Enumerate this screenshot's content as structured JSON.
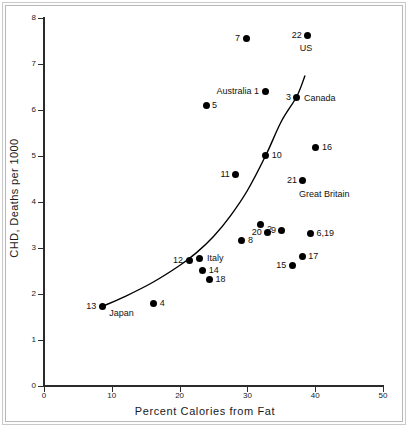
{
  "chart_data": {
    "type": "scatter",
    "title": "",
    "xlabel": "Percent Calories from Fat",
    "ylabel": "CHD, Deaths per 1000",
    "xlim": [
      0,
      50
    ],
    "ylim": [
      0,
      8
    ],
    "xticks": [
      0,
      10,
      20,
      30,
      40,
      50
    ],
    "yticks": [
      0,
      1,
      2,
      3,
      4,
      5,
      6,
      7,
      8
    ],
    "grid": false,
    "legend": "none",
    "points": [
      {
        "id": "1",
        "label": "Australia 1",
        "label_side": "left",
        "x": 32.6,
        "y": 6.4
      },
      {
        "id": "2",
        "label": "2",
        "label_side": "right",
        "x": 32.0,
        "y": 3.52
      },
      {
        "id": "3",
        "label": "3",
        "label_side": "left",
        "x": 37.3,
        "y": 6.28
      },
      {
        "id": "3b",
        "label": "Canada",
        "label_side": "right",
        "x": 37.3,
        "y": 6.28
      },
      {
        "id": "4",
        "label": "4",
        "label_side": "right",
        "x": 16.2,
        "y": 1.8
      },
      {
        "id": "5",
        "label": "5",
        "label_side": "right",
        "x": 23.9,
        "y": 6.09
      },
      {
        "id": "6",
        "label": "6,19",
        "label_side": "right",
        "x": 39.3,
        "y": 3.31
      },
      {
        "id": "7",
        "label": "7",
        "label_side": "left",
        "x": 29.8,
        "y": 7.55
      },
      {
        "id": "8",
        "label": "8",
        "label_side": "right",
        "x": 29.2,
        "y": 3.17
      },
      {
        "id": "9",
        "label": "9",
        "label_side": "left",
        "x": 35.1,
        "y": 3.39
      },
      {
        "id": "10",
        "label": "10",
        "label_side": "right",
        "x": 32.7,
        "y": 5.01
      },
      {
        "id": "11",
        "label": "11",
        "label_side": "left",
        "x": 28.3,
        "y": 4.59
      },
      {
        "id": "12",
        "label": "12",
        "label_side": "left",
        "x": 21.4,
        "y": 2.72
      },
      {
        "id": "13",
        "label": "13",
        "label_side": "left",
        "x": 8.6,
        "y": 1.73
      },
      {
        "id": "13b",
        "label": "Japan",
        "label_side": "right",
        "x": 8.6,
        "y": 1.73
      },
      {
        "id": "14",
        "label": "14",
        "label_side": "right",
        "x": 23.4,
        "y": 2.51
      },
      {
        "id": "15",
        "label": "15",
        "label_side": "left",
        "x": 36.6,
        "y": 2.62
      },
      {
        "id": "16",
        "label": "16",
        "label_side": "right",
        "x": 40.1,
        "y": 5.18
      },
      {
        "id": "17",
        "label": "17",
        "label_side": "right",
        "x": 38.1,
        "y": 2.82
      },
      {
        "id": "18",
        "label": "18",
        "label_side": "right",
        "x": 24.4,
        "y": 2.32
      },
      {
        "id": "20",
        "label": "20",
        "label_side": "left",
        "x": 33.0,
        "y": 3.34
      },
      {
        "id": "21",
        "label": "21",
        "label_side": "left",
        "x": 38.2,
        "y": 4.46
      },
      {
        "id": "21b",
        "label": "Great Britain",
        "label_side": "right",
        "x": 38.2,
        "y": 4.46
      },
      {
        "id": "22",
        "label": "22",
        "label_side": "left",
        "x": 38.9,
        "y": 7.63
      },
      {
        "id": "italy",
        "label": "Italy",
        "label_side": "right",
        "x": 23.0,
        "y": 2.77
      }
    ],
    "fit_curve": {
      "description": "fitted exponential-like trend curve",
      "x_start": 8.6,
      "x_end": 38.5,
      "points": [
        {
          "x": 8.6,
          "y": 1.73
        },
        {
          "x": 12.0,
          "y": 1.95
        },
        {
          "x": 16.0,
          "y": 2.25
        },
        {
          "x": 20.0,
          "y": 2.62
        },
        {
          "x": 22.5,
          "y": 2.9
        },
        {
          "x": 25.0,
          "y": 3.25
        },
        {
          "x": 27.5,
          "y": 3.7
        },
        {
          "x": 30.0,
          "y": 4.25
        },
        {
          "x": 32.7,
          "y": 5.01
        },
        {
          "x": 35.0,
          "y": 5.75
        },
        {
          "x": 37.3,
          "y": 6.3
        },
        {
          "x": 38.5,
          "y": 6.75
        }
      ]
    }
  },
  "axes": {
    "x_title": "Percent Calories from Fat",
    "y_title": "CHD, Deaths per 1000",
    "x_tick_labels": [
      "0",
      "10",
      "20",
      "30",
      "40",
      "50"
    ],
    "y_tick_labels": [
      "0",
      "1",
      "2",
      "3",
      "4",
      "5",
      "6",
      "7",
      "8"
    ]
  },
  "colors": {
    "marker": "#000000",
    "axis": "#2b2b2b",
    "text": "#1a1a1a",
    "curve": "#000000",
    "background": "#ffffff",
    "frame": "#c9c9c9"
  }
}
